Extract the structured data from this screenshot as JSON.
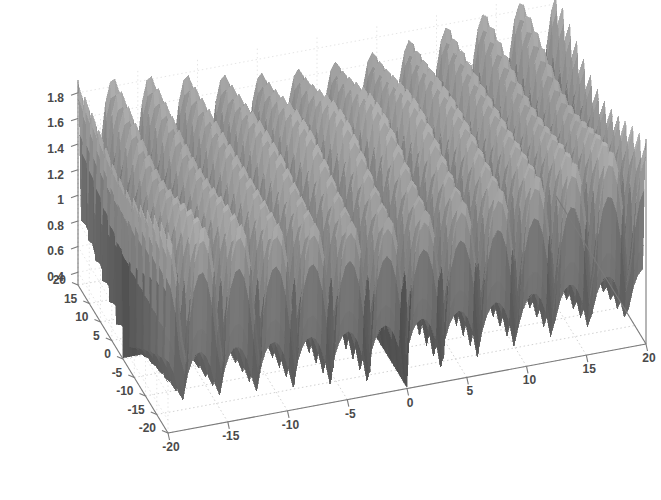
{
  "figure": {
    "title": "",
    "background_color": "#ffffff",
    "surface_color": "#6f6f6f",
    "surface_edge_color": "#555555",
    "axis_color": "#7a7a7a",
    "grid_color": "#bdbdbd",
    "tick_text_color": "#4a4a4a"
  },
  "chart_data": {
    "type": "surface",
    "title": "",
    "xlabel": "",
    "ylabel": "",
    "zlabel": "",
    "xlim": [
      -20,
      20
    ],
    "ylim": [
      -20,
      20
    ],
    "zlim": [
      0.3,
      1.9
    ],
    "grid": true,
    "legend": null,
    "projection": "3d",
    "view": {
      "azimuth": -37.5,
      "elevation": 30
    },
    "colormap": "gray",
    "shading": "faceted",
    "function": "z = 1.1 + 0.75*sin(pi*x/3.1)*sin(pi*y/3.1) style periodic lattice",
    "period_x": 3.1,
    "period_y": 3.1,
    "peak_count_x": 13,
    "peak_count_y": 13,
    "z_peak_value": 1.9,
    "z_valley_value": 0.3,
    "x_ticks": [
      -20,
      -15,
      -10,
      -5,
      0,
      5,
      10,
      15,
      20
    ],
    "x_tick_labels": [
      "-20",
      "-15",
      "-10",
      "-5",
      "0",
      "5",
      "10",
      "15",
      "20"
    ],
    "y_ticks": [
      -20,
      -15,
      -10,
      -5,
      0,
      5,
      10,
      15,
      20
    ],
    "y_tick_labels": [
      "-20",
      "-15",
      "-10",
      "-5",
      "0",
      "5",
      "10",
      "15",
      "20"
    ],
    "z_ticks": [
      0.4,
      0.6,
      0.8,
      1.0,
      1.2,
      1.4,
      1.6,
      1.8
    ],
    "z_tick_labels": [
      "0.4",
      "0.6",
      "0.8",
      "1",
      "1.2",
      "1.4",
      "1.6",
      "1.8"
    ]
  }
}
